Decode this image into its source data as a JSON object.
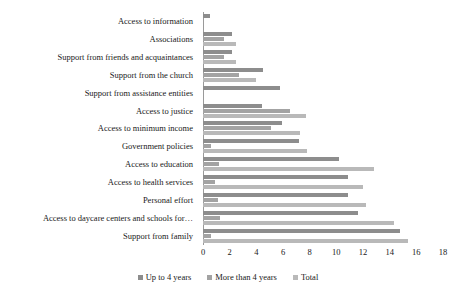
{
  "chart_data": {
    "type": "bar",
    "orientation": "horizontal",
    "title": "",
    "subtitle": "",
    "xlabel": "",
    "ylabel": "",
    "xlim": [
      0,
      18
    ],
    "xticks": [
      0,
      2,
      4,
      6,
      8,
      10,
      12,
      14,
      16,
      18
    ],
    "grid": false,
    "legend_position": "bottom",
    "categories": [
      "Access to information",
      "Associations",
      "Support from friends and acquaintances",
      "Support from the church",
      "Support from assistance entities",
      "Access to justice",
      "Access to minimum income",
      "Government policies",
      "Access to education",
      "Access to health services",
      "Personal effort",
      "Access to daycare centers and schools for…",
      "Support from family"
    ],
    "series": [
      {
        "name": "Up to 4 years",
        "color": "#8d8d8d",
        "values": [
          0.5,
          2.2,
          2.2,
          4.5,
          5.8,
          4.4,
          5.9,
          7.2,
          10.2,
          10.9,
          10.9,
          11.6,
          14.8
        ]
      },
      {
        "name": "More than 4 years",
        "color": "#a3a3a3",
        "values": [
          0,
          1.6,
          1.6,
          2.7,
          0,
          6.5,
          5.1,
          0.6,
          1.2,
          0.9,
          1.1,
          1.3,
          0.6
        ]
      },
      {
        "name": "Total",
        "color": "#b9b9b9",
        "values": [
          0,
          2.5,
          2.5,
          4.0,
          0,
          7.7,
          7.3,
          7.8,
          12.8,
          12.0,
          12.2,
          14.3,
          15.4
        ]
      }
    ]
  },
  "legend": {
    "items": [
      {
        "label": "Up to 4 years",
        "color": "#8d8d8d"
      },
      {
        "label": "More than 4 years",
        "color": "#a3a3a3"
      },
      {
        "label": "Total",
        "color": "#b9b9b9"
      }
    ]
  }
}
